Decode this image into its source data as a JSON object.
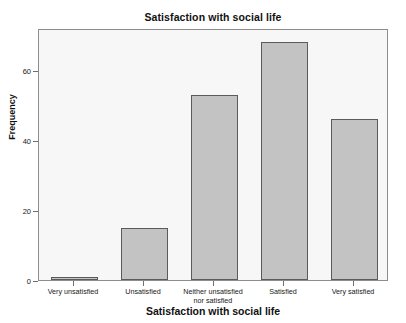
{
  "chart_data": {
    "type": "bar",
    "title": "Satisfaction with social life",
    "xlabel": "Satisfaction with social life",
    "ylabel": "Frequency",
    "categories": [
      "Very unsatisfied",
      "Unsatisfied",
      "Neither unsatisfied nor satisfied",
      "Satisfied",
      "Very satisfied"
    ],
    "category_lines": [
      [
        "Very unsatisfied"
      ],
      [
        "Unsatisfied"
      ],
      [
        "Neither unsatisfied",
        "nor satisfied"
      ],
      [
        "Satisfied"
      ],
      [
        "Very satisfied"
      ]
    ],
    "values": [
      1,
      15,
      53,
      68,
      46
    ],
    "ylim": [
      0,
      72
    ],
    "yticks": [
      0,
      20,
      40,
      60
    ],
    "ytick_labels": [
      "0",
      "20",
      "40",
      "60"
    ],
    "grid": false,
    "legend": false,
    "bar_fill_color": "#c3c3c3",
    "bar_edge_color": "#5b5b5b",
    "plot_background_color": "#f7f7f7",
    "frame_color": "#8d8d8d"
  }
}
